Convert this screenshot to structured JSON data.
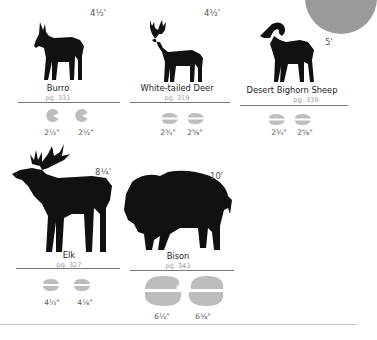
{
  "accent_colors": {
    "silhouette": "#111111",
    "track": "#bdbdbd",
    "corner_circle": "#9a9a9a",
    "rule": "#777777"
  },
  "animals": [
    {
      "name": "Burro",
      "page": "pg. 331",
      "height": "4½'",
      "track_sizes": [
        "2½\"",
        "2½\""
      ],
      "icon": "burro-silhouette-icon",
      "track_icon": "hoof-track-icon"
    },
    {
      "name": "White-tailed Deer",
      "page": "pg. 319",
      "height": "4½'",
      "track_sizes": [
        "2¾\"",
        "2⅝\""
      ],
      "icon": "deer-silhouette-icon",
      "track_icon": "cloven-track-icon"
    },
    {
      "name": "Desert Bighorn Sheep",
      "page": "pg. 339",
      "height": "5'",
      "track_sizes": [
        "2¾\"",
        "2⅝\""
      ],
      "icon": "bighorn-sheep-silhouette-icon",
      "track_icon": "cloven-track-icon"
    },
    {
      "name": "Elk",
      "page": "pg. 327",
      "height": "8¼'",
      "track_sizes": [
        "4¼\"",
        "4⅛\""
      ],
      "icon": "elk-silhouette-icon",
      "track_icon": "cloven-track-icon"
    },
    {
      "name": "Bison",
      "page": "pg. 343",
      "height": "10'",
      "track_sizes": [
        "6½\"",
        "6⅜\""
      ],
      "icon": "bison-silhouette-icon",
      "track_icon": "cloven-track-icon"
    }
  ]
}
